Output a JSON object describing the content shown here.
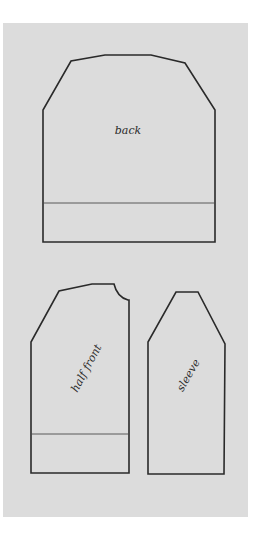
{
  "diagram": {
    "title": "",
    "colors": {
      "page_background": "#ffffff",
      "panel_background": "#dcdcdc",
      "outline": "#2a2a2a"
    },
    "pieces": [
      {
        "id": "back",
        "label": "back",
        "has_hem_band": true
      },
      {
        "id": "half-front",
        "label": "half front",
        "has_hem_band": true
      },
      {
        "id": "sleeve",
        "label": "sleeve",
        "has_hem_band": false
      }
    ]
  }
}
